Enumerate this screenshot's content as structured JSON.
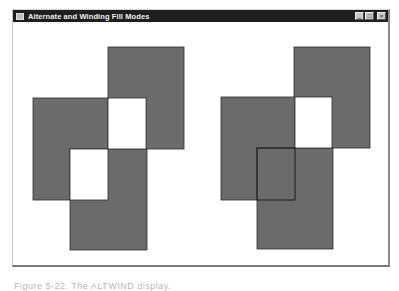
{
  "window": {
    "title": "Alternate and Winding Fill Modes",
    "controls": {
      "minimize_glyph": "_",
      "maximize_glyph": "□",
      "close_glyph": "×"
    }
  },
  "colors": {
    "fill": "#6b6b6b",
    "outline": "#2e2e2e",
    "background": "#ffffff",
    "titlebar": "#1e1e1e"
  },
  "figures": [
    {
      "name": "alternate-fill-figure",
      "fill_mode": "alternate",
      "rects": [
        {
          "x": 107,
          "y": 46,
          "w": 76,
          "h": 102
        },
        {
          "x": 32,
          "y": 97,
          "w": 75,
          "h": 102
        },
        {
          "x": 69,
          "y": 148,
          "w": 77,
          "h": 101
        }
      ],
      "holes": [
        {
          "x": 107,
          "y": 97,
          "w": 38,
          "h": 51
        },
        {
          "x": 69,
          "y": 148,
          "w": 38,
          "h": 51
        }
      ]
    },
    {
      "name": "winding-fill-figure",
      "fill_mode": "winding",
      "rects": [
        {
          "x": 293,
          "y": 46,
          "w": 76,
          "h": 101
        },
        {
          "x": 220,
          "y": 96,
          "w": 74,
          "h": 103
        },
        {
          "x": 256,
          "y": 147,
          "w": 76,
          "h": 101
        }
      ],
      "holes": [
        {
          "x": 294,
          "y": 96,
          "w": 37,
          "h": 51
        }
      ],
      "inner_outline": {
        "x": 256,
        "y": 147,
        "w": 38,
        "h": 52
      }
    }
  ],
  "caption": "Figure 5-22.  The ALTWIND display."
}
